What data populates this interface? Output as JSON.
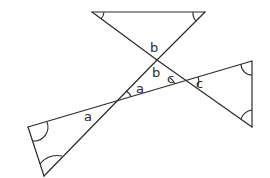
{
  "diagram": {
    "type": "geometry-angles",
    "labels": {
      "b_top": "b",
      "b_inner": "b",
      "a_inner": "a",
      "a_outer": "a",
      "c_inner": "c",
      "c_outer": "c"
    },
    "points": {
      "top_left": [
        92,
        12
      ],
      "top_right": [
        205,
        12
      ],
      "cross_b": [
        157,
        60
      ],
      "cross_a": [
        117,
        101
      ],
      "cross_c": [
        187,
        80
      ],
      "right_top": [
        252,
        61
      ],
      "right_bottom": [
        252,
        127
      ],
      "left_top": [
        28,
        127
      ],
      "left_bottom": [
        44,
        176
      ]
    },
    "colors": {
      "line": "#2a2a2a",
      "background": "#ffffff"
    }
  }
}
